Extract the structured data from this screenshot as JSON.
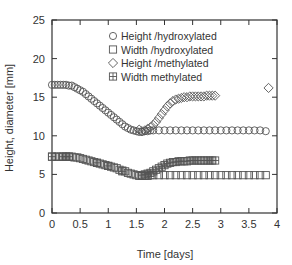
{
  "chart_data": {
    "type": "scatter",
    "title": "",
    "xlabel": "Time [days]",
    "ylabel": "Height, diameter [mm]",
    "xlim": [
      0,
      4
    ],
    "ylim": [
      0,
      25
    ],
    "xticks": [
      "0",
      "0.5",
      "1",
      "1.5",
      "2",
      "2.5",
      "3",
      "3.5",
      "4"
    ],
    "xtick_values": [
      0,
      0.5,
      1,
      1.5,
      2,
      2.5,
      3,
      3.5,
      4
    ],
    "yticks": [
      "0",
      "5",
      "10",
      "15",
      "20",
      "25"
    ],
    "ytick_values": [
      0,
      5,
      10,
      15,
      20,
      25
    ],
    "grid": false,
    "legend_position": "upper right (inside)",
    "series": [
      {
        "name": "Height /hydroxylated",
        "marker": "circle",
        "x": [
          0,
          0.05,
          0.1,
          0.15,
          0.2,
          0.25,
          0.3,
          0.35,
          0.4,
          0.45,
          0.5,
          0.55,
          0.6,
          0.65,
          0.7,
          0.75,
          0.8,
          0.85,
          0.9,
          0.95,
          1.0,
          1.05,
          1.1,
          1.15,
          1.2,
          1.25,
          1.3,
          1.35,
          1.4,
          1.45,
          1.5,
          1.55,
          1.6,
          1.65,
          1.7,
          1.75,
          1.8,
          1.9,
          2.0,
          2.1,
          2.2,
          2.3,
          2.4,
          2.5,
          2.6,
          2.7,
          2.8,
          2.9,
          3.0,
          3.1,
          3.2,
          3.3,
          3.4,
          3.5,
          3.6,
          3.7,
          3.8
        ],
        "values": [
          16.6,
          16.6,
          16.6,
          16.6,
          16.6,
          16.6,
          16.5,
          16.5,
          16.3,
          16.1,
          15.9,
          15.7,
          15.4,
          15.1,
          14.8,
          14.5,
          14.2,
          13.9,
          13.6,
          13.3,
          13.0,
          12.7,
          12.4,
          12.1,
          11.8,
          11.5,
          11.2,
          11.0,
          10.8,
          10.7,
          10.6,
          10.5,
          10.5,
          10.6,
          10.6,
          10.7,
          10.7,
          10.7,
          10.7,
          10.7,
          10.7,
          10.7,
          10.7,
          10.7,
          10.7,
          10.7,
          10.7,
          10.7,
          10.7,
          10.7,
          10.7,
          10.7,
          10.7,
          10.7,
          10.7,
          10.7,
          10.6
        ]
      },
      {
        "name": "Width /hydroxylated",
        "marker": "square",
        "x": [
          0,
          0.05,
          0.1,
          0.15,
          0.2,
          0.25,
          0.3,
          0.35,
          0.4,
          0.45,
          0.5,
          0.55,
          0.6,
          0.65,
          0.7,
          0.75,
          0.8,
          0.85,
          0.9,
          0.95,
          1.0,
          1.05,
          1.1,
          1.15,
          1.2,
          1.25,
          1.3,
          1.35,
          1.4,
          1.45,
          1.5,
          1.55,
          1.6,
          1.65,
          1.7,
          1.75,
          1.8,
          1.9,
          2.0,
          2.1,
          2.2,
          2.3,
          2.4,
          2.5,
          2.6,
          2.7,
          2.8,
          2.9,
          3.0,
          3.1,
          3.2,
          3.3,
          3.4,
          3.5,
          3.6,
          3.7,
          3.8
        ],
        "values": [
          7.3,
          7.3,
          7.3,
          7.3,
          7.3,
          7.3,
          7.3,
          7.3,
          7.2,
          7.2,
          7.1,
          7.0,
          6.9,
          6.8,
          6.7,
          6.6,
          6.5,
          6.4,
          6.3,
          6.2,
          6.1,
          6.0,
          5.9,
          5.8,
          5.6,
          5.5,
          5.4,
          5.2,
          5.1,
          5.0,
          4.9,
          4.8,
          4.8,
          4.8,
          4.8,
          4.9,
          4.9,
          4.9,
          4.9,
          4.9,
          4.9,
          4.9,
          4.9,
          4.9,
          4.9,
          4.9,
          4.9,
          4.9,
          4.9,
          4.9,
          4.9,
          4.9,
          4.9,
          4.9,
          4.9,
          4.9,
          4.9
        ]
      },
      {
        "name": "Height /methylated",
        "marker": "diamond",
        "x": [
          1.55,
          1.6,
          1.65,
          1.7,
          1.75,
          1.8,
          1.85,
          1.9,
          1.95,
          2.0,
          2.05,
          2.1,
          2.15,
          2.2,
          2.25,
          2.3,
          2.35,
          2.4,
          2.45,
          2.5,
          2.55,
          2.6,
          2.65,
          2.7,
          2.75,
          2.8,
          2.85,
          2.9,
          3.85
        ],
        "values": [
          10.8,
          10.6,
          10.7,
          10.9,
          11.1,
          11.4,
          11.8,
          12.3,
          12.8,
          13.3,
          13.8,
          14.2,
          14.5,
          14.7,
          14.8,
          14.9,
          15.0,
          15.0,
          15.1,
          15.1,
          15.1,
          15.1,
          15.1,
          15.1,
          15.2,
          15.2,
          15.2,
          15.2,
          16.2
        ]
      },
      {
        "name": "Width methylated",
        "marker": "square-cross",
        "x": [
          0,
          0.2,
          0.25,
          0.3,
          0.8,
          1.0,
          1.25,
          1.6,
          1.65,
          1.7,
          1.75,
          1.8,
          1.85,
          1.9,
          1.95,
          2.0,
          2.05,
          2.1,
          2.15,
          2.2,
          2.25,
          2.3,
          2.35,
          2.4,
          2.45,
          2.5,
          2.55,
          2.6,
          2.65,
          2.7,
          2.75,
          2.8,
          2.85,
          2.9
        ],
        "values": [
          7.3,
          7.3,
          7.3,
          7.3,
          6.5,
          6.1,
          5.4,
          4.9,
          5.0,
          5.1,
          5.2,
          5.4,
          5.6,
          5.8,
          6.0,
          6.2,
          6.4,
          6.5,
          6.6,
          6.6,
          6.7,
          6.7,
          6.7,
          6.7,
          6.8,
          6.8,
          6.8,
          6.8,
          6.8,
          6.8,
          6.8,
          6.8,
          6.8,
          6.8
        ]
      }
    ]
  },
  "legend": {
    "items": [
      {
        "label": "Height /hydroxylated",
        "marker": "circle"
      },
      {
        "label": "Width /hydroxylated",
        "marker": "square"
      },
      {
        "label": "Height /methylated",
        "marker": "diamond"
      },
      {
        "label": "Width methylated",
        "marker": "square-cross"
      }
    ]
  },
  "colors": {
    "axis": "#333333",
    "marker_stroke": "#555555",
    "background": "#ffffff"
  }
}
